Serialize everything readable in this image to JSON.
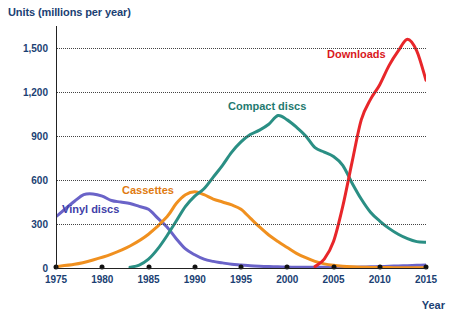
{
  "chart_data": {
    "type": "line",
    "title": "",
    "ylabel": "Units (millions per year)",
    "xlabel": "Year",
    "ylim": [
      0,
      1650
    ],
    "xlim": [
      1975,
      2015
    ],
    "grid": true,
    "legend_position": "inline-labels",
    "y_ticks": [
      0,
      300,
      600,
      900,
      1200,
      1500
    ],
    "y_tick_labels": [
      "0",
      "300",
      "600",
      "900",
      "1,200",
      "1,500"
    ],
    "x_ticks": [
      1975,
      1980,
      1985,
      1990,
      1995,
      2000,
      2005,
      2010,
      2015
    ],
    "x_tick_labels": [
      "1975",
      "1980",
      "1985",
      "1990",
      "1995",
      "2000",
      "2005",
      "2010",
      "2015"
    ],
    "series": [
      {
        "name": "Vinyl discs",
        "color": "#6a63c8",
        "label_color": "#3f3fa8",
        "x": [
          1975,
          1977,
          1978,
          1979,
          1980,
          1981,
          1982,
          1983,
          1984,
          1985,
          1986,
          1987,
          1988,
          1989,
          1990,
          1991,
          1992,
          1993,
          1994,
          1995,
          1996,
          1997,
          1998,
          1999,
          2000,
          2001,
          2002,
          2003,
          2004,
          2005,
          2006,
          2007,
          2008,
          2009,
          2010,
          2011,
          2012,
          2013,
          2014,
          2015
        ],
        "values": [
          350,
          455,
          500,
          505,
          490,
          460,
          450,
          440,
          420,
          400,
          340,
          280,
          200,
          130,
          90,
          60,
          45,
          35,
          25,
          20,
          15,
          12,
          10,
          8,
          6,
          5,
          5,
          5,
          5,
          5,
          5,
          5,
          6,
          8,
          10,
          12,
          14,
          16,
          18,
          20
        ]
      },
      {
        "name": "Cassettes",
        "color": "#f0901f",
        "label_color": "#e07a10",
        "x": [
          1975,
          1977,
          1979,
          1981,
          1983,
          1985,
          1987,
          1988,
          1989,
          1990,
          1991,
          1992,
          1993,
          1994,
          1995,
          1996,
          1997,
          1998,
          1999,
          2000,
          2001,
          2002,
          2003,
          2004,
          2005,
          2006,
          2007,
          2008,
          2009,
          2010,
          2011,
          2012,
          2013,
          2014,
          2015
        ],
        "values": [
          10,
          25,
          55,
          95,
          150,
          230,
          350,
          440,
          500,
          520,
          500,
          470,
          450,
          430,
          400,
          340,
          280,
          225,
          180,
          140,
          100,
          70,
          45,
          28,
          18,
          12,
          8,
          5,
          4,
          3,
          3,
          2,
          2,
          2,
          2
        ]
      },
      {
        "name": "Compact discs",
        "color": "#2a8f84",
        "label_color": "#1f7a70",
        "x": [
          1983,
          1984,
          1985,
          1986,
          1987,
          1988,
          1989,
          1990,
          1991,
          1992,
          1993,
          1994,
          1995,
          1996,
          1997,
          1998,
          1999,
          2000,
          2001,
          2002,
          2003,
          2004,
          2005,
          2006,
          2007,
          2008,
          2009,
          2010,
          2011,
          2012,
          2013,
          2014,
          2015
        ],
        "values": [
          5,
          20,
          60,
          130,
          220,
          320,
          420,
          490,
          540,
          620,
          700,
          790,
          860,
          910,
          940,
          980,
          1040,
          1010,
          960,
          900,
          820,
          790,
          760,
          700,
          580,
          470,
          380,
          320,
          270,
          230,
          200,
          180,
          175
        ]
      },
      {
        "name": "Downloads",
        "color": "#e8262a",
        "label_color": "#d9181c",
        "x": [
          2003,
          2004,
          2005,
          2006,
          2007,
          2008,
          2009,
          2010,
          2011,
          2012,
          2013,
          2014,
          2015
        ],
        "values": [
          10,
          60,
          180,
          420,
          720,
          1010,
          1150,
          1250,
          1380,
          1480,
          1560,
          1480,
          1280
        ]
      }
    ]
  },
  "labels": {
    "vinyl": "Vinyl discs",
    "cassettes": "Cassettes",
    "compact_discs": "Compact discs",
    "downloads": "Downloads",
    "y_axis_title": "Units (millions per year)",
    "x_axis_title": "Year"
  }
}
